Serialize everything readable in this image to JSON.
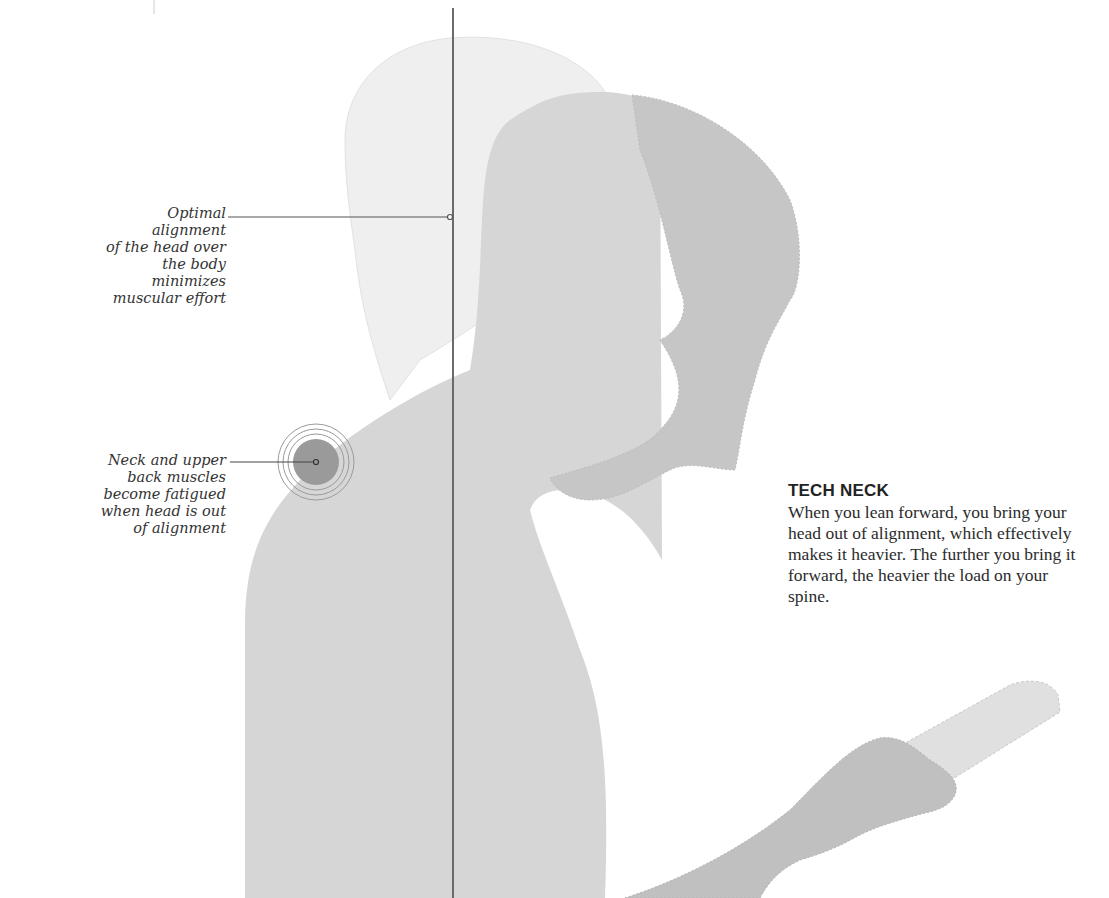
{
  "diagram": {
    "title": "TECH NECK",
    "body": "When you lean forward, you bring your head out of alignment, which effectively makes it heavier. The further you bring it forward, the heavier the load on your spine.",
    "callouts": [
      {
        "id": "alignment",
        "lines": [
          "Optimal alignment",
          "of the head over",
          "the body minimizes",
          "muscular effort"
        ]
      },
      {
        "id": "neck",
        "lines": [
          "Neck and upper",
          "back muscles",
          "become fatigued",
          "when head is out",
          "of alignment"
        ]
      }
    ],
    "colors": {
      "upright_silhouette": "#ececec",
      "body_silhouette": "#d3d3d3",
      "forward_head": "#c4c4c4",
      "hand": "#bfbfbf",
      "phone": "#dedede",
      "alignment_line": "#6a6a6a",
      "fatigue_spot": "#9a9a9a",
      "text": "#333333"
    }
  }
}
